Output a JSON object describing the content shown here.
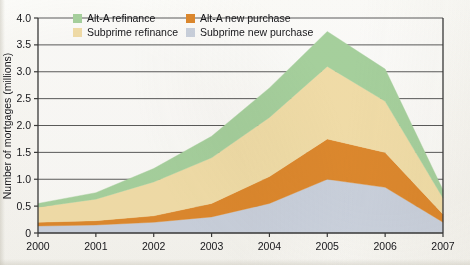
{
  "chart_data": {
    "type": "area",
    "stacked": true,
    "title": "",
    "xlabel": "",
    "ylabel": "Number of mortgages (millions)",
    "x": [
      2000,
      2001,
      2002,
      2003,
      2004,
      2005,
      2006,
      2007
    ],
    "categories": [
      "2000",
      "2001",
      "2002",
      "2003",
      "2004",
      "2005",
      "2006",
      "2007"
    ],
    "xlim": [
      2000,
      2007
    ],
    "ylim": [
      0,
      4.0
    ],
    "yticks": [
      "0",
      "0.5",
      "1.0",
      "1.5",
      "2.0",
      "2.5",
      "3.0",
      "3.5",
      "4.0"
    ],
    "ytick_values": [
      0,
      0.5,
      1.0,
      1.5,
      2.0,
      2.5,
      3.0,
      3.5,
      4.0
    ],
    "grid": "horizontal",
    "legend_position": "top-left-inside",
    "series": [
      {
        "name": "Subprime new purchase",
        "color": "#ccd3e0",
        "stack_order": 1,
        "values": [
          0.13,
          0.15,
          0.2,
          0.3,
          0.55,
          1.0,
          0.85,
          0.2
        ]
      },
      {
        "name": "Alt-A new purchase",
        "color": "#e08a2e",
        "stack_order": 2,
        "values": [
          0.07,
          0.08,
          0.12,
          0.25,
          0.5,
          0.75,
          0.65,
          0.15
        ]
      },
      {
        "name": "Subprime refinance",
        "color": "#f4e0ab",
        "stack_order": 3,
        "values": [
          0.28,
          0.4,
          0.63,
          0.85,
          1.1,
          1.35,
          0.95,
          0.3
        ]
      },
      {
        "name": "Alt-A refinance",
        "color": "#a8d3a0",
        "stack_order": 4,
        "values": [
          0.07,
          0.12,
          0.25,
          0.4,
          0.55,
          0.65,
          0.6,
          0.15
        ]
      }
    ],
    "cumulative_tops": {
      "subprime_new_purchase": [
        0.13,
        0.15,
        0.2,
        0.3,
        0.55,
        1.0,
        0.85,
        0.2
      ],
      "alt_a_new_purchase": [
        0.2,
        0.23,
        0.32,
        0.55,
        1.05,
        1.75,
        1.5,
        0.35
      ],
      "subprime_refinance": [
        0.48,
        0.63,
        0.95,
        1.4,
        2.15,
        3.1,
        2.45,
        0.65
      ],
      "alt_a_refinance": [
        0.55,
        0.75,
        1.2,
        1.8,
        2.7,
        3.75,
        3.05,
        0.8
      ]
    },
    "legend": [
      {
        "label": "Alt-A refinance",
        "color": "#a8d3a0"
      },
      {
        "label": "Alt-A new purchase",
        "color": "#e08a2e"
      },
      {
        "label": "Subprime refinance",
        "color": "#f4e0ab"
      },
      {
        "label": "Subprime new purchase",
        "color": "#ccd3e0"
      }
    ]
  }
}
